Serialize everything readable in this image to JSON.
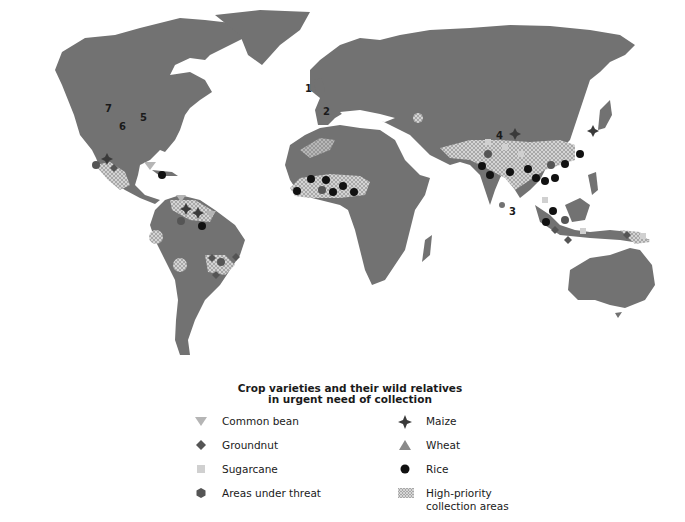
{
  "map": {
    "land_color": "#727272",
    "ocean_color": "#ffffff",
    "numbered_labels": [
      {
        "id": "1",
        "x": 305,
        "y": 88
      },
      {
        "id": "2",
        "x": 323,
        "y": 111
      },
      {
        "id": "3",
        "x": 509,
        "y": 211
      },
      {
        "id": "4",
        "x": 496,
        "y": 135
      },
      {
        "id": "5",
        "x": 142,
        "y": 117
      },
      {
        "id": "6",
        "x": 121,
        "y": 126
      },
      {
        "id": "7",
        "x": 107,
        "y": 108
      }
    ]
  },
  "legend": {
    "title_line1": "Crop varieties and their wild relatives",
    "title_line2": "in urgent need of collection",
    "items": [
      {
        "symbol": "common-bean",
        "label": "Common bean",
        "color": "#b5b5b5"
      },
      {
        "symbol": "groundnut",
        "label": "Groundnut",
        "color": "#555555"
      },
      {
        "symbol": "sugarcane",
        "label": "Sugarcane",
        "color": "#d0d0d0"
      },
      {
        "symbol": "areas-under-threat",
        "label": "Areas under threat",
        "color": "#555555"
      },
      {
        "symbol": "maize",
        "label": "Maize",
        "color": "#3a3a3a"
      },
      {
        "symbol": "wheat",
        "label": "Wheat",
        "color": "#8a8a8a"
      },
      {
        "symbol": "rice",
        "label": "Rice",
        "color": "#111111"
      },
      {
        "symbol": "high-priority-areas",
        "label_line1": "High-priority",
        "label_line2": "collection areas",
        "color": "#bdbdbd"
      }
    ]
  }
}
